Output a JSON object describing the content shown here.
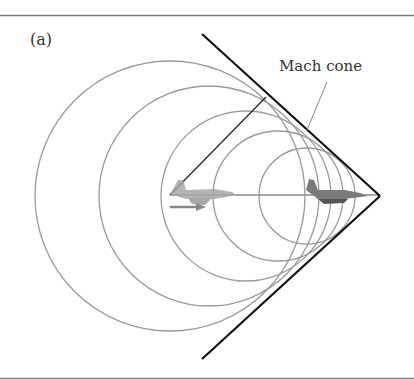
{
  "figure": {
    "panel_label": "(a)",
    "annotation": "Mach cone",
    "colors": {
      "cone_line": "#111111",
      "wavefront": "#999999",
      "border": "#777777",
      "aircraft": "#8a8a8a"
    },
    "cone": {
      "apex": [
        380,
        196
      ],
      "upper_end": [
        202,
        34
      ],
      "lower_end": [
        202,
        359
      ]
    },
    "wavefronts": [
      {
        "cx": 170,
        "cy": 196,
        "r": 135
      },
      {
        "cx": 209,
        "cy": 196,
        "r": 110
      },
      {
        "cx": 246,
        "cy": 196,
        "r": 85
      },
      {
        "cx": 278,
        "cy": 196,
        "r": 65
      },
      {
        "cx": 307,
        "cy": 196,
        "r": 48
      }
    ],
    "elements": [
      "aircraft-past-position",
      "aircraft-current-position",
      "velocity-arrow",
      "radius-line"
    ]
  }
}
